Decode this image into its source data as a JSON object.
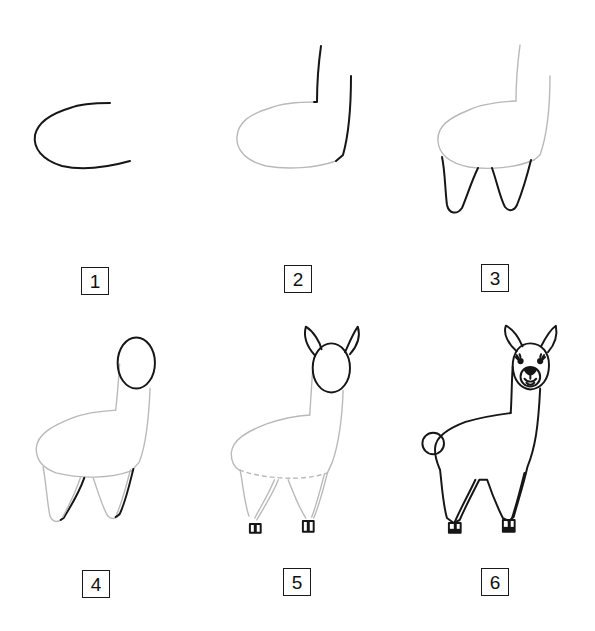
{
  "colors": {
    "background": "#ffffff",
    "ink": "#161616",
    "guide_line": "#b9b9b9",
    "box_border": "#1a1a1a"
  },
  "steps": [
    {
      "number": "1",
      "description": "Draw a C-shaped curve for the body"
    },
    {
      "number": "2",
      "description": "Add two vertical lines for the neck"
    },
    {
      "number": "3",
      "description": "Draw two tapered front legs under the body"
    },
    {
      "number": "4",
      "description": "Add an oval head and the back legs"
    },
    {
      "number": "5",
      "description": "Add two pointed ears and small hooves"
    },
    {
      "number": "6",
      "description": "Finish with face details, tail and outline"
    }
  ]
}
